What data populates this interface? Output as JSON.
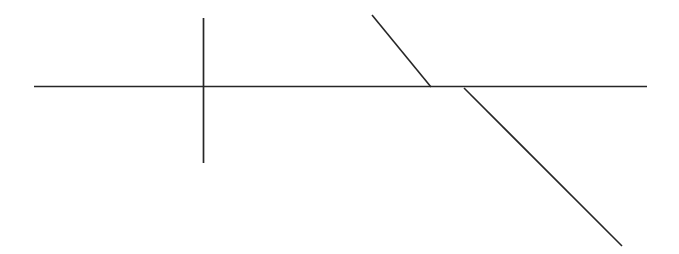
{
  "canvas": {
    "width": 679,
    "height": 254,
    "background_color": "#ffffff",
    "title": "Line Diagram"
  },
  "style": {
    "line_color": "#262626",
    "line_width": 1.5
  },
  "figure": {
    "type": "line-drawing"
  },
  "shapes": [
    {
      "id": "horizontal-baseline",
      "kind": "line",
      "label": "horizontal line",
      "x1": 34,
      "y1": 86.5,
      "x2": 647,
      "y2": 86.5,
      "color": "#262626",
      "width": 1.7
    },
    {
      "id": "vertical-line",
      "kind": "line",
      "label": "vertical line",
      "x1": 203.5,
      "y1": 18,
      "x2": 203.5,
      "y2": 163,
      "color": "#262626",
      "width": 1.7
    },
    {
      "id": "steep-diagonal",
      "kind": "line",
      "label": "steep descending diagonal",
      "x1": 372,
      "y1": 15,
      "x2": 431,
      "y2": 87,
      "color": "#262626",
      "width": 1.6
    },
    {
      "id": "shallow-diagonal",
      "kind": "line",
      "label": "shallow descending diagonal",
      "x1": 464,
      "y1": 88,
      "x2": 622,
      "y2": 246,
      "color": "#262626",
      "width": 1.6
    }
  ],
  "intersections": [
    {
      "id": "cross-point",
      "label": "vertical meets horizontal",
      "x": 203,
      "y": 86
    },
    {
      "id": "steep-meets-baseline",
      "label": "steep diagonal meets horizontal",
      "x": 431,
      "y": 87
    },
    {
      "id": "shallow-leaves-baseline",
      "label": "shallow diagonal leaves horizontal",
      "x": 464,
      "y": 88
    }
  ]
}
